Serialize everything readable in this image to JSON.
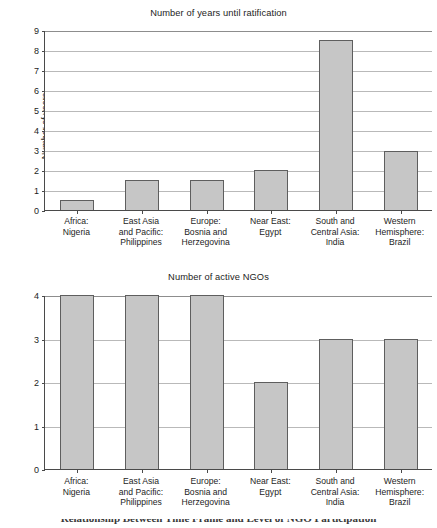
{
  "figure": {
    "caption_partial": "Relationship Between Time Frame and Level of NGO Participation"
  },
  "categories": [
    "Africa:\nNigeria",
    "East Asia\nand Pacific:\nPhilippines",
    "Europe:\nBosnia and\nHerzegovina",
    "Near East:\nEgypt",
    "South and\nCentral Asia:\nIndia",
    "Western\nHemisphere:\nBrazil"
  ],
  "charts": [
    {
      "title": "Number of years until ratification",
      "ylabel": "Number of years",
      "yticks": [
        "0",
        "1",
        "2",
        "3",
        "4",
        "5",
        "6",
        "7",
        "8",
        "9"
      ]
    },
    {
      "title": "Number of active NGOs",
      "ylabel": "Number of active NGOs",
      "yticks": [
        "0",
        "1",
        "2",
        "3",
        "4"
      ]
    }
  ],
  "chart_data": [
    {
      "type": "bar",
      "title": "Number of years until ratification",
      "xlabel": "",
      "ylabel": "Number of years",
      "categories": [
        "Africa: Nigeria",
        "East Asia and Pacific: Philippines",
        "Europe: Bosnia and Herzegovina",
        "Near East: Egypt",
        "South and Central Asia: India",
        "Western Hemisphere: Brazil"
      ],
      "values": [
        0.5,
        1.5,
        1.5,
        2.0,
        8.5,
        2.95
      ],
      "ylim": [
        0,
        9
      ],
      "ytick_step": 1,
      "grid": "horizontal",
      "legend": "none",
      "bar_fill": "#c6c6c6",
      "bar_edge": "#5e5e5e"
    },
    {
      "type": "bar",
      "title": "Number of active NGOs",
      "xlabel": "",
      "ylabel": "Number of active NGOs",
      "categories": [
        "Africa: Nigeria",
        "East Asia and Pacific: Philippines",
        "Europe: Bosnia and Herzegovina",
        "Near East: Egypt",
        "South and Central Asia: India",
        "Western Hemisphere: Brazil"
      ],
      "values": [
        4,
        4,
        4,
        2,
        3,
        3
      ],
      "ylim": [
        0,
        4
      ],
      "ytick_step": 1,
      "grid": "horizontal",
      "legend": "none",
      "bar_fill": "#c6c6c6",
      "bar_edge": "#5e5e5e"
    }
  ]
}
